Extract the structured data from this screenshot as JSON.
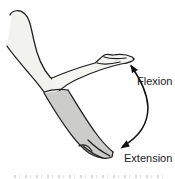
{
  "diagram": {
    "labels": {
      "flexion": "Flexion",
      "extension": "Extension"
    },
    "icons": {
      "motion_arrow": "double-headed-curved-arc-arrow"
    },
    "colors": {
      "background": "#ffffff",
      "outline": "#1e1e1e",
      "upper_arm_fill": "#f2f2ef",
      "forearm_flexed_fill": "#f4f4f1",
      "forearm_extended_fill": "#ccccca",
      "label_text": "#1b1b1b",
      "caption_fragment": "#adadab"
    }
  }
}
